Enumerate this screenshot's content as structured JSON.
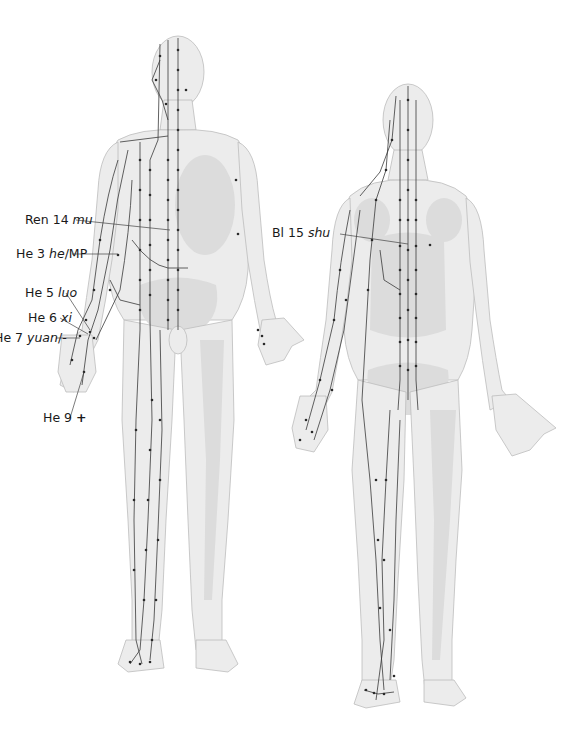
{
  "diagram": {
    "title": "",
    "figures": [
      {
        "name": "front-view",
        "view": "anterior"
      },
      {
        "name": "back-view",
        "view": "posterior"
      }
    ],
    "colors": {
      "body_fill": "#ebebeb",
      "body_shade": "#d9d9d9",
      "outline": "#b5b5b5",
      "meridian_line": "#3a3a3a",
      "point": "#2a2a2a",
      "label_text": "#1a1a1a",
      "background": "#ffffff"
    },
    "labels": [
      {
        "id": "ren14",
        "code": "Ren 14",
        "name": "mu",
        "suffix": ""
      },
      {
        "id": "he3",
        "code": "He 3",
        "name": "he",
        "suffix": "/MP"
      },
      {
        "id": "he5",
        "code": "He 5",
        "name": "luo",
        "suffix": ""
      },
      {
        "id": "he6",
        "code": "He 6",
        "name": "xi",
        "suffix": ""
      },
      {
        "id": "he7",
        "code": "He 7",
        "name": "yuan",
        "suffix": "/-"
      },
      {
        "id": "he9",
        "code": "He 9",
        "name": "",
        "suffix": "+"
      },
      {
        "id": "bl15",
        "code": "Bl 15",
        "name": "shu",
        "suffix": ""
      }
    ]
  }
}
